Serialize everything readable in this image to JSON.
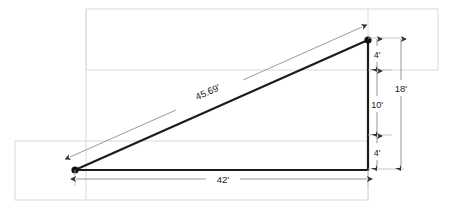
{
  "diagram": {
    "units": "feet",
    "colors": {
      "background": "#ffffff",
      "shape_stroke": "#1c1c1c",
      "dimension_line": "#8a8a8a",
      "ghost_rect": "#d8d8d8",
      "text": "#1a1a1a"
    },
    "vertices": {
      "left_label": "left-vertex-node",
      "right_label": "right-vertex-node"
    },
    "dimensions": [
      {
        "name": "hypotenuse",
        "label": "45.69'",
        "value": 45.69,
        "orientation": "diagonal"
      },
      {
        "name": "rise-upper",
        "label": "4'",
        "value": 4,
        "orientation": "vertical"
      },
      {
        "name": "rise-middle",
        "label": "10'",
        "value": 10,
        "orientation": "vertical"
      },
      {
        "name": "rise-lower",
        "label": "4'",
        "value": 4,
        "orientation": "vertical"
      },
      {
        "name": "rise-total",
        "label": "18'",
        "value": 18,
        "orientation": "vertical"
      },
      {
        "name": "run",
        "label": "42'",
        "value": 42,
        "orientation": "horizontal"
      }
    ],
    "labels": {
      "hypotenuse": "45.69'",
      "rise_upper": "4'",
      "rise_middle": "10'",
      "rise_lower": "4'",
      "rise_total": "18'",
      "run": "42'"
    }
  }
}
